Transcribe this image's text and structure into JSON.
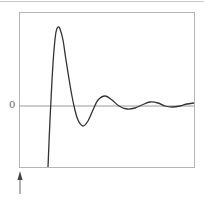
{
  "figure": {
    "zero_label": "0",
    "colors": {
      "curve": "#333333",
      "frame": "#b5b5b5",
      "zero_line": "#9a9a9a",
      "arrow": "#444444",
      "top_rule": "#c8c8c8"
    }
  },
  "chart_data": {
    "type": "line",
    "title": "",
    "xlabel": "",
    "ylabel": "",
    "y_ticks": [
      "0"
    ],
    "annotations": [
      {
        "type": "arrow",
        "direction": "up",
        "position": "below x-axis at left edge",
        "meaning": "impulse time marker"
      }
    ],
    "points_px": [
      [
        48,
        167
      ],
      [
        50,
        120
      ],
      [
        52,
        80
      ],
      [
        54,
        50
      ],
      [
        56,
        32
      ],
      [
        58,
        27
      ],
      [
        60,
        29
      ],
      [
        63,
        40
      ],
      [
        66,
        60
      ],
      [
        70,
        85
      ],
      [
        74,
        106
      ],
      [
        78,
        120
      ],
      [
        83,
        126
      ],
      [
        88,
        121
      ],
      [
        93,
        110
      ],
      [
        98,
        100
      ],
      [
        105,
        96
      ],
      [
        112,
        100
      ],
      [
        119,
        106
      ],
      [
        127,
        109
      ],
      [
        135,
        108
      ],
      [
        142,
        105
      ],
      [
        150,
        102
      ],
      [
        158,
        103
      ],
      [
        165,
        106
      ],
      [
        172,
        107
      ],
      [
        180,
        106
      ],
      [
        187,
        104
      ],
      [
        194,
        103
      ]
    ]
  }
}
